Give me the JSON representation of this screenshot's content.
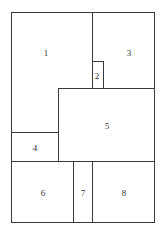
{
  "diagram": {
    "type": "floor-plan partition",
    "regions": [
      {
        "id": "1",
        "label": "1",
        "x": 11,
        "y": 12,
        "w": 82,
        "h": 121
      },
      {
        "id": "2",
        "label": "2",
        "x": 92,
        "y": 61,
        "w": 12,
        "h": 28
      },
      {
        "id": "3",
        "label": "3",
        "x": 92,
        "y": 12,
        "w": 63,
        "h": 77
      },
      {
        "id": "4",
        "label": "4",
        "x": 11,
        "y": 133,
        "w": 48,
        "h": 29
      },
      {
        "id": "5",
        "label": "5",
        "x": 58,
        "y": 88,
        "w": 97,
        "h": 74
      },
      {
        "id": "6",
        "label": "6",
        "x": 11,
        "y": 161,
        "w": 63,
        "h": 62
      },
      {
        "id": "7",
        "label": "7",
        "x": 73,
        "y": 161,
        "w": 20,
        "h": 62
      },
      {
        "id": "8",
        "label": "8",
        "x": 92,
        "y": 161,
        "w": 63,
        "h": 62
      }
    ]
  }
}
